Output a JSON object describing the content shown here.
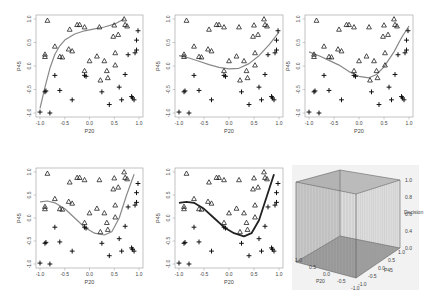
{
  "figure": {
    "panel_count": 6,
    "layout": "2 rows x 3 columns"
  },
  "chart_data": [
    {
      "type": "scatter",
      "panel": 1,
      "xlabel": "P20",
      "ylabel": "P45",
      "xlim": [
        -1.0,
        1.0
      ],
      "ylim": [
        -1.0,
        1.0
      ],
      "xticks": [
        "-1.0",
        "-0.5",
        "0.0",
        "0.5",
        "1.0"
      ],
      "yticks": [
        "-1.0",
        "-0.5",
        "0.0",
        "0.5",
        "1.0"
      ],
      "curve_color": "#888888",
      "curve_width": 1.2,
      "curve": [
        [
          -1.0,
          -0.9
        ],
        [
          -0.9,
          -0.45
        ],
        [
          -0.8,
          -0.05
        ],
        [
          -0.7,
          0.25
        ],
        [
          -0.6,
          0.43
        ],
        [
          -0.5,
          0.55
        ],
        [
          -0.3,
          0.68
        ],
        [
          -0.1,
          0.75
        ],
        [
          0.1,
          0.79
        ],
        [
          0.3,
          0.83
        ],
        [
          0.5,
          0.89
        ],
        [
          0.7,
          1.0
        ]
      ]
    },
    {
      "type": "scatter",
      "panel": 2,
      "xlabel": "P20",
      "ylabel": "P45",
      "xlim": [
        -1.0,
        1.0
      ],
      "ylim": [
        -1.0,
        1.0
      ],
      "xticks": [
        "-1.0",
        "-0.5",
        "0.0",
        "0.5",
        "1.0"
      ],
      "yticks": [
        "-1.0",
        "-0.5",
        "0.0",
        "0.5",
        "1.0"
      ],
      "curve_color": "#888888",
      "curve_width": 1.2,
      "curve": [
        [
          -1.0,
          0.22
        ],
        [
          -0.8,
          0.17
        ],
        [
          -0.6,
          0.1
        ],
        [
          -0.4,
          0.03
        ],
        [
          -0.2,
          -0.03
        ],
        [
          0.0,
          -0.06
        ],
        [
          0.2,
          -0.05
        ],
        [
          0.4,
          0.05
        ],
        [
          0.6,
          0.22
        ],
        [
          0.8,
          0.45
        ],
        [
          1.0,
          0.72
        ]
      ]
    },
    {
      "type": "scatter",
      "panel": 3,
      "xlabel": "P20",
      "ylabel": "P45",
      "xlim": [
        -1.0,
        1.0
      ],
      "ylim": [
        -1.0,
        1.0
      ],
      "xticks": [
        "-1.0",
        "-0.5",
        "0.0",
        "0.5",
        "1.0"
      ],
      "yticks": [
        "-1.0",
        "-0.5",
        "0.0",
        "0.5",
        "1.0"
      ],
      "curve_color": "#888888",
      "curve_width": 1.2,
      "curve": [
        [
          -1.0,
          0.3
        ],
        [
          -0.8,
          0.22
        ],
        [
          -0.6,
          0.12
        ],
        [
          -0.4,
          0.02
        ],
        [
          -0.2,
          -0.12
        ],
        [
          0.0,
          -0.22
        ],
        [
          0.2,
          -0.25
        ],
        [
          0.35,
          -0.18
        ],
        [
          0.5,
          -0.02
        ],
        [
          0.7,
          0.3
        ],
        [
          0.85,
          0.6
        ],
        [
          1.0,
          0.85
        ]
      ]
    },
    {
      "type": "scatter",
      "panel": 4,
      "xlabel": "P20",
      "ylabel": "P45",
      "xlim": [
        -1.0,
        1.0
      ],
      "ylim": [
        -1.0,
        1.0
      ],
      "xticks": [
        "-1.0",
        "-0.5",
        "0.0",
        "0.5",
        "1.0"
      ],
      "yticks": [
        "-1.0",
        "-0.5",
        "0.0",
        "0.5",
        "1.0"
      ],
      "curve_color": "#888888",
      "curve_width": 1.2,
      "curve": [
        [
          -1.0,
          0.35
        ],
        [
          -0.85,
          0.37
        ],
        [
          -0.7,
          0.33
        ],
        [
          -0.5,
          0.2
        ],
        [
          -0.3,
          0.0
        ],
        [
          -0.1,
          -0.2
        ],
        [
          0.1,
          -0.33
        ],
        [
          0.3,
          -0.37
        ],
        [
          0.45,
          -0.3
        ],
        [
          0.6,
          0.0
        ],
        [
          0.75,
          0.5
        ],
        [
          0.9,
          0.95
        ]
      ]
    },
    {
      "type": "scatter",
      "panel": 5,
      "xlabel": "P20",
      "ylabel": "P45",
      "xlim": [
        -1.0,
        1.0
      ],
      "ylim": [
        -1.0,
        1.0
      ],
      "xticks": [
        "-1.0",
        "-0.5",
        "0.0",
        "0.5",
        "1.0"
      ],
      "yticks": [
        "-1.0",
        "-0.5",
        "0.0",
        "0.5",
        "1.0"
      ],
      "curve_color": "#222222",
      "curve_width": 1.8,
      "curve": [
        [
          -1.0,
          0.33
        ],
        [
          -0.85,
          0.35
        ],
        [
          -0.7,
          0.33
        ],
        [
          -0.5,
          0.2
        ],
        [
          -0.3,
          0.0
        ],
        [
          -0.1,
          -0.2
        ],
        [
          0.1,
          -0.33
        ],
        [
          0.3,
          -0.4
        ],
        [
          0.45,
          -0.33
        ],
        [
          0.6,
          -0.05
        ],
        [
          0.75,
          0.45
        ],
        [
          0.9,
          0.95
        ]
      ]
    },
    {
      "type": "surface3d",
      "panel": 6,
      "xlabel": "P20",
      "ylabel": "P45",
      "zlabel": "Decision",
      "zticks": [
        "0.0",
        "0.4",
        "0.6",
        "0.8",
        "1.0"
      ],
      "xticks": [
        "1.0",
        "0.5",
        "0.0",
        "-0.5",
        "-1.0"
      ],
      "yticks": [
        "-1.0",
        "-0.5",
        "0.0",
        "0.5",
        "1.0"
      ],
      "background": "#f2f2f2"
    }
  ],
  "points": {
    "triangles": [
      [
        -0.85,
        0.97
      ],
      [
        -0.9,
        0.25
      ],
      [
        -0.9,
        0.2
      ],
      [
        -0.7,
        0.42
      ],
      [
        -0.6,
        0.2
      ],
      [
        -0.55,
        0.19
      ],
      [
        -0.4,
        0.78
      ],
      [
        -0.42,
        0.36
      ],
      [
        -0.35,
        0.32
      ],
      [
        -0.25,
        0.88
      ],
      [
        -0.2,
        0.88
      ],
      [
        -0.1,
        0.83
      ],
      [
        -0.1,
        -0.1
      ],
      [
        0.0,
        0.11
      ],
      [
        0.15,
        0.21
      ],
      [
        0.2,
        0.83
      ],
      [
        0.22,
        -0.3
      ],
      [
        0.3,
        0.11
      ],
      [
        0.35,
        -0.1
      ],
      [
        0.37,
        -0.25
      ],
      [
        0.48,
        0.63
      ],
      [
        0.5,
        0.87
      ],
      [
        0.52,
        0.28
      ],
      [
        0.52,
        0.02
      ],
      [
        0.58,
        0.67
      ],
      [
        0.7,
        1.0
      ],
      [
        0.72,
        0.88
      ],
      [
        0.76,
        0.85
      ]
    ],
    "crosses": [
      [
        -1.0,
        -0.98
      ],
      [
        -0.9,
        -0.55
      ],
      [
        -0.88,
        -0.53
      ],
      [
        -0.8,
        -1.0
      ],
      [
        -0.7,
        -0.2
      ],
      [
        -0.6,
        -0.52
      ],
      [
        -0.35,
        -0.72
      ],
      [
        -0.1,
        -0.2
      ],
      [
        -0.07,
        -0.22
      ],
      [
        0.25,
        -0.55
      ],
      [
        0.4,
        -0.82
      ],
      [
        0.6,
        -0.45
      ],
      [
        0.65,
        -0.72
      ],
      [
        0.72,
        -0.18
      ],
      [
        0.78,
        0.24
      ],
      [
        0.85,
        -0.65
      ],
      [
        0.87,
        -0.68
      ],
      [
        0.9,
        -0.72
      ],
      [
        0.92,
        0.28
      ],
      [
        0.95,
        0.34
      ],
      [
        0.95,
        0.55
      ],
      [
        0.98,
        0.75
      ]
    ]
  }
}
